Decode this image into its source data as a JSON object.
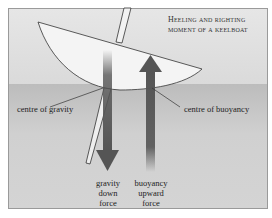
{
  "title": {
    "line1": "Heeling and righting",
    "line2": "moment of a keelboat"
  },
  "labels": {
    "centre_of_gravity": "centre of gravity",
    "centre_of_buoyancy": "centre of buoyancy",
    "gravity_force": [
      "gravity",
      "down",
      "force"
    ],
    "buoyancy_force": [
      "buoyancy",
      "upward",
      "force"
    ]
  },
  "colors": {
    "sky": "#e0e0e0",
    "water": "#c4c4c4",
    "hull": "#f4f4f4",
    "arrow": "#555555",
    "line": "#333333"
  }
}
